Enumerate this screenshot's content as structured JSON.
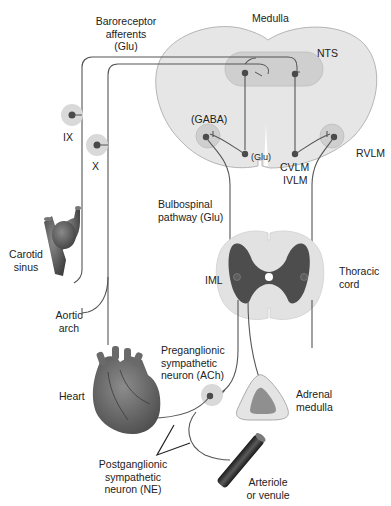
{
  "colors": {
    "medulla_fill": "#e6e6e6",
    "medulla_stroke": "#b5b5b5",
    "nucleus_fill": "#cfcfcf",
    "neuron_body": "#4a4a4a",
    "nerve_line": "#555555",
    "grey_matter": "#4d4d4d",
    "cord_fill": "#e2e2e2",
    "vessel": "#3a3a3a",
    "heart": "#606060",
    "text": "#222222"
  },
  "labels": {
    "medulla": "Medulla",
    "nts": "NTS",
    "baroreceptor": [
      "Baroreceptor",
      "afferents",
      "(Glu)"
    ],
    "gaba": "(GABA)",
    "glu": "(Glu)",
    "cvlm": "CVLM",
    "ivlm": "IVLM",
    "rvlm": "RVLM",
    "ix": "IX",
    "x": "X",
    "carotid": [
      "Carotid",
      "sinus"
    ],
    "aortic": [
      "Aortic",
      "arch"
    ],
    "bulbospinal": [
      "Bulbospinal",
      "pathway (Glu)"
    ],
    "iml": "IML",
    "thoracic": [
      "Thoracic",
      "cord"
    ],
    "preganglionic": [
      "Preganglionic",
      "sympathetic",
      "neuron (ACh)"
    ],
    "heart": "Heart",
    "adrenal": [
      "Adrenal",
      "medulla"
    ],
    "postganglionic": [
      "Postganglionic",
      "sympathetic",
      "neuron (NE)"
    ],
    "arteriole": [
      "Arteriole",
      "or venule"
    ]
  }
}
